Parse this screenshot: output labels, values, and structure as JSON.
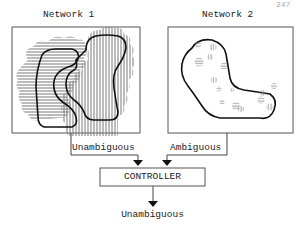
{
  "page_number": "247",
  "network1": {
    "title": "Network 1",
    "output_label": "Unambiguous"
  },
  "network2": {
    "title": "Network 2",
    "output_label": "Ambiguous"
  },
  "controller": {
    "label": "CONTROLLER",
    "output_label": "Unambiguous"
  },
  "colors": {
    "line": "#222222",
    "hatch": "#777777",
    "background": "#ffffff"
  }
}
